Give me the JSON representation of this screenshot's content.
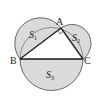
{
  "figure": {
    "points": {
      "A": {
        "label": "A",
        "x": 61,
        "y": 28
      },
      "B": {
        "label": "B",
        "x": 20,
        "y": 59
      },
      "C": {
        "label": "C",
        "x": 83,
        "y": 59
      }
    },
    "regions": [
      {
        "label": "S",
        "sub": "1"
      },
      {
        "label": "S",
        "sub": "2"
      },
      {
        "label": "S",
        "sub": "3"
      }
    ],
    "colors": {
      "fill": "#dadada",
      "stroke": "#333333",
      "background": "#ffffff"
    },
    "right_angle_at": "A"
  }
}
